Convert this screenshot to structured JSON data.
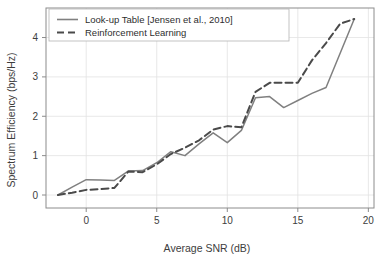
{
  "chart_data": {
    "type": "line",
    "title": "",
    "xlabel": "Average SNR (dB)",
    "ylabel": "Spectrum Efficiency (bps/Hz)",
    "xlim": [
      -2.85,
      20.4
    ],
    "ylim": [
      -0.33,
      4.75
    ],
    "xticks": [
      0,
      5,
      10,
      15,
      20
    ],
    "xtick_labels": [
      "0",
      "5",
      "10",
      "15",
      "20"
    ],
    "yticks": [
      0,
      1,
      2,
      3,
      4
    ],
    "ytick_labels": [
      "0",
      "1",
      "2",
      "3",
      "4"
    ],
    "grid": true,
    "legend_position": "upper left",
    "line_color": "#808080",
    "grid_color": "#e2e2e2",
    "axis_color": "#8c8c8c",
    "x": [
      -2,
      -1,
      0,
      1,
      2,
      3,
      4,
      5,
      6,
      7,
      8,
      9,
      10,
      11,
      12,
      13,
      14,
      15,
      16,
      17,
      18,
      19
    ],
    "series": [
      {
        "name": "Look-up Table [Jensen et al., 2010]",
        "style": "solid",
        "values": [
          0.0,
          0.2,
          0.39,
          0.38,
          0.37,
          0.61,
          0.62,
          0.82,
          1.1,
          1.0,
          1.3,
          1.58,
          1.33,
          1.64,
          2.47,
          2.5,
          2.22,
          2.4,
          2.58,
          2.73,
          3.6,
          4.47
        ]
      },
      {
        "name": "Reinforcement Learning",
        "style": "dashed",
        "values": [
          0.0,
          0.06,
          0.13,
          0.15,
          0.18,
          0.6,
          0.58,
          0.78,
          1.04,
          1.2,
          1.39,
          1.66,
          1.75,
          1.72,
          2.62,
          2.85,
          2.85,
          2.85,
          3.42,
          3.86,
          4.35,
          4.47
        ]
      }
    ]
  },
  "legend": {
    "entries": [
      {
        "label": "Look-up Table [Jensen et al., 2010]",
        "style": "solid"
      },
      {
        "label": "Reinforcement Learning",
        "style": "dashed"
      }
    ]
  }
}
